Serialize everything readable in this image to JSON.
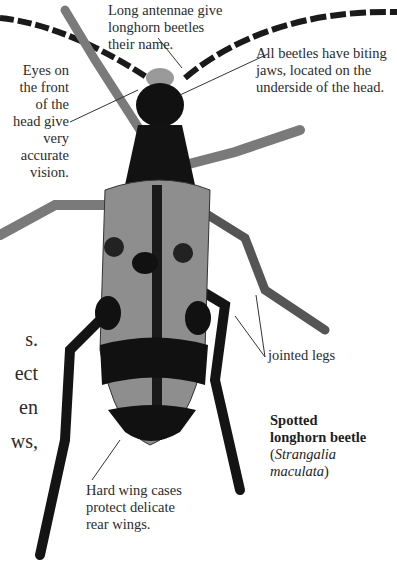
{
  "figure": {
    "subject": "Spotted longhorn beetle",
    "colors": {
      "background": "#ffffff",
      "body_dark": "#111111",
      "elytra": "#8e8e8e",
      "text": "#2b2b2b",
      "leader_line": "#333333"
    }
  },
  "annotations": {
    "antennae": "Long antennae give\nlonghorn beetles\ntheir name.",
    "jaws": "All beetles have biting\njaws, located on the\nunderside of the head.",
    "eyes": "Eyes on\nthe front\nof the\nhead give\nvery\naccurate\nvision.",
    "legs": "jointed legs",
    "wings": "Hard wing cases\nprotect delicate\nrear wings."
  },
  "caption": {
    "common_name_line1": "Spotted",
    "common_name_line2": "longhorn beetle",
    "scientific_open": "(",
    "scientific_line1": "Strangalia",
    "scientific_line2": "maculata",
    "scientific_close": ")"
  },
  "cropped_body_text": "s.\nect\nen\nws,"
}
